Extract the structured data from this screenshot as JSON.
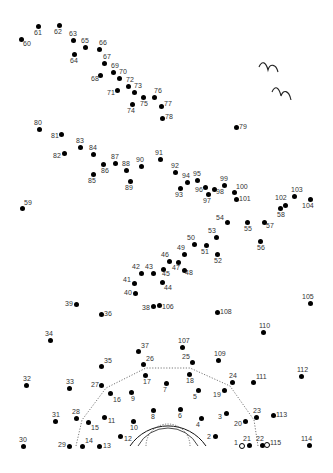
{
  "puzzle": {
    "type": "connect-the-dots",
    "dot_count": 115,
    "dots": [
      {
        "n": 1,
        "x": 242,
        "y": 446,
        "open": true,
        "lx": -8,
        "ly": -7
      },
      {
        "n": 2,
        "x": 215,
        "y": 436,
        "lx": -8,
        "ly": -3
      },
      {
        "n": 3,
        "x": 226,
        "y": 413,
        "lx": -8,
        "ly": 0
      },
      {
        "n": 4,
        "x": 201,
        "y": 418,
        "lx": -5,
        "ly": 3
      },
      {
        "n": 5,
        "x": 198,
        "y": 390,
        "lx": -5,
        "ly": 3
      },
      {
        "n": 6,
        "x": 180,
        "y": 409,
        "lx": -2,
        "ly": 3
      },
      {
        "n": 7,
        "x": 166,
        "y": 383,
        "lx": -3,
        "ly": 3
      },
      {
        "n": 8,
        "x": 153,
        "y": 410,
        "lx": -2,
        "ly": 3
      },
      {
        "n": 9,
        "x": 131,
        "y": 392,
        "lx": 0,
        "ly": 3
      },
      {
        "n": 10,
        "x": 133,
        "y": 421,
        "lx": -3,
        "ly": 3
      },
      {
        "n": 11,
        "x": 104,
        "y": 417,
        "lx": 4,
        "ly": 0
      },
      {
        "n": 12,
        "x": 120,
        "y": 436,
        "lx": 4,
        "ly": -1
      },
      {
        "n": 13,
        "x": 99,
        "y": 446,
        "lx": 4,
        "ly": -4
      },
      {
        "n": 14,
        "x": 82,
        "y": 446,
        "lx": 3,
        "ly": -9
      },
      {
        "n": 15,
        "x": 88,
        "y": 422,
        "lx": 3,
        "ly": 2
      },
      {
        "n": 16,
        "x": 110,
        "y": 393,
        "lx": 3,
        "ly": 3
      },
      {
        "n": 17,
        "x": 145,
        "y": 375,
        "lx": -2,
        "ly": 3
      },
      {
        "n": 18,
        "x": 189,
        "y": 374,
        "lx": -3,
        "ly": 3
      },
      {
        "n": 19,
        "x": 224,
        "y": 390,
        "lx": -11,
        "ly": 1
      },
      {
        "n": 20,
        "x": 245,
        "y": 421,
        "lx": -11,
        "ly": -1
      },
      {
        "n": 21,
        "x": 249,
        "y": 445,
        "lx": -6,
        "ly": -10
      },
      {
        "n": 22,
        "x": 262,
        "y": 445,
        "lx": -6,
        "ly": -10
      },
      {
        "n": 23,
        "x": 256,
        "y": 417,
        "lx": -3,
        "ly": -10
      },
      {
        "n": 24,
        "x": 232,
        "y": 382,
        "lx": -3,
        "ly": -10
      },
      {
        "n": 25,
        "x": 192,
        "y": 362,
        "lx": -10,
        "ly": -9
      },
      {
        "n": 26,
        "x": 143,
        "y": 364,
        "lx": 3,
        "ly": -9
      },
      {
        "n": 27,
        "x": 101,
        "y": 385,
        "lx": -10,
        "ly": -4
      },
      {
        "n": 28,
        "x": 76,
        "y": 418,
        "lx": -4,
        "ly": -10
      },
      {
        "n": 29,
        "x": 69,
        "y": 446,
        "lx": -11,
        "ly": -5
      },
      {
        "n": 30,
        "x": 23,
        "y": 446,
        "lx": -4,
        "ly": -10
      },
      {
        "n": 31,
        "x": 55,
        "y": 421,
        "lx": -3,
        "ly": -10
      },
      {
        "n": 32,
        "x": 26,
        "y": 385,
        "lx": -3,
        "ly": -10
      },
      {
        "n": 33,
        "x": 69,
        "y": 388,
        "lx": -3,
        "ly": -10
      },
      {
        "n": 34,
        "x": 50,
        "y": 340,
        "lx": -5,
        "ly": -10
      },
      {
        "n": 35,
        "x": 101,
        "y": 366,
        "lx": 3,
        "ly": -9
      },
      {
        "n": 36,
        "x": 101,
        "y": 314,
        "lx": 3,
        "ly": -4
      },
      {
        "n": 37,
        "x": 138,
        "y": 351,
        "lx": 3,
        "ly": -9
      },
      {
        "n": 38,
        "x": 153,
        "y": 306,
        "lx": -11,
        "ly": -2
      },
      {
        "n": 39,
        "x": 76,
        "y": 304,
        "lx": -11,
        "ly": -4
      },
      {
        "n": 40,
        "x": 135,
        "y": 293,
        "lx": -11,
        "ly": -4
      },
      {
        "n": 41,
        "x": 134,
        "y": 283,
        "lx": -11,
        "ly": -7
      },
      {
        "n": 42,
        "x": 141,
        "y": 273,
        "lx": -9,
        "ly": -10
      },
      {
        "n": 43,
        "x": 153,
        "y": 273,
        "lx": -8,
        "ly": -10
      },
      {
        "n": 44,
        "x": 162,
        "y": 282,
        "lx": 2,
        "ly": 2
      },
      {
        "n": 45,
        "x": 163,
        "y": 269,
        "lx": -1,
        "ly": 1
      },
      {
        "n": 46,
        "x": 169,
        "y": 261,
        "lx": -8,
        "ly": -10
      },
      {
        "n": 47,
        "x": 178,
        "y": 262,
        "lx": -6,
        "ly": 2
      },
      {
        "n": 48,
        "x": 184,
        "y": 270,
        "lx": 1,
        "ly": -1
      },
      {
        "n": 49,
        "x": 184,
        "y": 254,
        "lx": -7,
        "ly": -10
      },
      {
        "n": 50,
        "x": 194,
        "y": 244,
        "lx": -7,
        "ly": -10
      },
      {
        "n": 51,
        "x": 206,
        "y": 245,
        "lx": -5,
        "ly": 3
      },
      {
        "n": 52,
        "x": 217,
        "y": 254,
        "lx": -3,
        "ly": 3
      },
      {
        "n": 53,
        "x": 216,
        "y": 237,
        "lx": -8,
        "ly": -10
      },
      {
        "n": 54,
        "x": 227,
        "y": 222,
        "lx": -11,
        "ly": -8
      },
      {
        "n": 55,
        "x": 247,
        "y": 222,
        "lx": -3,
        "ly": 3
      },
      {
        "n": 56,
        "x": 260,
        "y": 241,
        "lx": -3,
        "ly": 3
      },
      {
        "n": 57,
        "x": 264,
        "y": 222,
        "lx": 2,
        "ly": 0
      },
      {
        "n": 58,
        "x": 280,
        "y": 208,
        "lx": -3,
        "ly": 3
      },
      {
        "n": 59,
        "x": 22,
        "y": 208,
        "lx": 2,
        "ly": -9
      },
      {
        "n": 60,
        "x": 21,
        "y": 39,
        "lx": 2,
        "ly": 1
      },
      {
        "n": 61,
        "x": 38,
        "y": 26,
        "lx": -4,
        "ly": 3
      },
      {
        "n": 62,
        "x": 59,
        "y": 25,
        "lx": -5,
        "ly": 3
      },
      {
        "n": 63,
        "x": 73,
        "y": 40,
        "lx": -4,
        "ly": -10
      },
      {
        "n": 64,
        "x": 74,
        "y": 54,
        "lx": -4,
        "ly": 3
      },
      {
        "n": 65,
        "x": 85,
        "y": 47,
        "lx": -4,
        "ly": -10
      },
      {
        "n": 66,
        "x": 99,
        "y": 49,
        "lx": 0,
        "ly": -10
      },
      {
        "n": 67,
        "x": 104,
        "y": 63,
        "lx": -1,
        "ly": -10
      },
      {
        "n": 68,
        "x": 100,
        "y": 75,
        "lx": -9,
        "ly": 0
      },
      {
        "n": 69,
        "x": 113,
        "y": 72,
        "lx": -2,
        "ly": -10
      },
      {
        "n": 70,
        "x": 119,
        "y": 78,
        "lx": 0,
        "ly": -10
      },
      {
        "n": 71,
        "x": 117,
        "y": 90,
        "lx": -10,
        "ly": -1
      },
      {
        "n": 72,
        "x": 128,
        "y": 86,
        "lx": -2,
        "ly": -10
      },
      {
        "n": 73,
        "x": 134,
        "y": 92,
        "lx": 0,
        "ly": -10
      },
      {
        "n": 74,
        "x": 132,
        "y": 104,
        "lx": -5,
        "ly": 3
      },
      {
        "n": 75,
        "x": 143,
        "y": 97,
        "lx": -3,
        "ly": 3
      },
      {
        "n": 76,
        "x": 154,
        "y": 97,
        "lx": 0,
        "ly": -10
      },
      {
        "n": 77,
        "x": 161,
        "y": 106,
        "lx": 3,
        "ly": -6
      },
      {
        "n": 78,
        "x": 162,
        "y": 118,
        "lx": 3,
        "ly": -5
      },
      {
        "n": 79,
        "x": 236,
        "y": 127,
        "lx": 3,
        "ly": -4
      },
      {
        "n": 80,
        "x": 39,
        "y": 129,
        "lx": -5,
        "ly": -10
      },
      {
        "n": 81,
        "x": 61,
        "y": 134,
        "lx": -10,
        "ly": -2
      },
      {
        "n": 82,
        "x": 64,
        "y": 153,
        "lx": -11,
        "ly": -1
      },
      {
        "n": 83,
        "x": 80,
        "y": 147,
        "lx": -4,
        "ly": -10
      },
      {
        "n": 84,
        "x": 93,
        "y": 154,
        "lx": -4,
        "ly": -10
      },
      {
        "n": 85,
        "x": 93,
        "y": 174,
        "lx": -5,
        "ly": 3
      },
      {
        "n": 86,
        "x": 103,
        "y": 164,
        "lx": -2,
        "ly": 3
      },
      {
        "n": 87,
        "x": 115,
        "y": 163,
        "lx": -4,
        "ly": -10
      },
      {
        "n": 88,
        "x": 126,
        "y": 170,
        "lx": -4,
        "ly": -10
      },
      {
        "n": 89,
        "x": 130,
        "y": 181,
        "lx": -5,
        "ly": 3
      },
      {
        "n": 90,
        "x": 141,
        "y": 166,
        "lx": -5,
        "ly": -10
      },
      {
        "n": 91,
        "x": 160,
        "y": 159,
        "lx": -5,
        "ly": -10
      },
      {
        "n": 92,
        "x": 175,
        "y": 172,
        "lx": -4,
        "ly": -10
      },
      {
        "n": 93,
        "x": 180,
        "y": 188,
        "lx": -5,
        "ly": 3
      },
      {
        "n": 94,
        "x": 187,
        "y": 182,
        "lx": -5,
        "ly": -10
      },
      {
        "n": 95,
        "x": 197,
        "y": 180,
        "lx": -4,
        "ly": -10
      },
      {
        "n": 96,
        "x": 205,
        "y": 187,
        "lx": -10,
        "ly": -1
      },
      {
        "n": 97,
        "x": 208,
        "y": 194,
        "lx": -5,
        "ly": 3
      },
      {
        "n": 98,
        "x": 214,
        "y": 189,
        "lx": 2,
        "ly": -1
      },
      {
        "n": 99,
        "x": 224,
        "y": 185,
        "lx": -4,
        "ly": -10
      },
      {
        "n": 100,
        "x": 234,
        "y": 192,
        "lx": 2,
        "ly": -9
      },
      {
        "n": 101,
        "x": 236,
        "y": 199,
        "lx": 3,
        "ly": -4
      },
      {
        "n": 102,
        "x": 285,
        "y": 205,
        "lx": -10,
        "ly": -11
      },
      {
        "n": 103,
        "x": 294,
        "y": 196,
        "lx": -3,
        "ly": -10
      },
      {
        "n": 104,
        "x": 310,
        "y": 199,
        "lx": -8,
        "ly": 3
      },
      {
        "n": 105,
        "x": 310,
        "y": 303,
        "lx": -8,
        "ly": -10
      },
      {
        "n": 106,
        "x": 159,
        "y": 305,
        "lx": 3,
        "ly": -2
      },
      {
        "n": 107,
        "x": 182,
        "y": 347,
        "lx": -4,
        "ly": -10
      },
      {
        "n": 108,
        "x": 217,
        "y": 312,
        "lx": 3,
        "ly": -4
      },
      {
        "n": 109,
        "x": 218,
        "y": 360,
        "lx": -4,
        "ly": -10
      },
      {
        "n": 110,
        "x": 263,
        "y": 332,
        "lx": -4,
        "ly": -10
      },
      {
        "n": 111,
        "x": 253,
        "y": 382,
        "lx": 3,
        "ly": -9
      },
      {
        "n": 112,
        "x": 301,
        "y": 376,
        "lx": -4,
        "ly": -10
      },
      {
        "n": 113,
        "x": 273,
        "y": 415,
        "lx": 3,
        "ly": -4
      },
      {
        "n": 114,
        "x": 309,
        "y": 445,
        "lx": -8,
        "ly": -10
      },
      {
        "n": 115,
        "x": 267,
        "y": 445,
        "open": true,
        "lx": 3,
        "ly": -6
      }
    ],
    "decorations": {
      "birds": 2,
      "dotted_outline": "bell-shaped dotted guide around bottom-center",
      "arcs": "three concentric semicircles (two solid, one dotted) at bottom-center"
    },
    "colors": {
      "ink": "#000000",
      "label": "#333333",
      "background": "#ffffff"
    }
  }
}
